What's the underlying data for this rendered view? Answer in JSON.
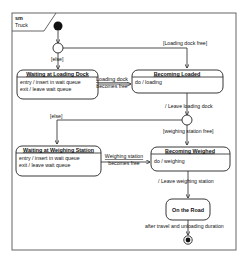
{
  "frame": {
    "kind": "sm",
    "name": "Truck"
  },
  "states": {
    "waiting_loading": {
      "name": "Waiting at Loading Dock",
      "entry": "entry / insert in wait queue",
      "exit": "exit / leave wait queue"
    },
    "becoming_loaded": {
      "name": "Becoming Loaded",
      "do": "do / loading"
    },
    "waiting_weighing": {
      "name": "Waiting at Weighing Station",
      "entry": "entry / insert in wait queue",
      "exit": "exit / leave wait queue"
    },
    "becoming_weighed": {
      "name": "Becoming Weighed",
      "do": "do / weighing"
    },
    "on_the_road": {
      "name": "On the Road"
    }
  },
  "transitions": {
    "else1": "[else]",
    "loading_free": "[Loading dock free]",
    "loading_becomes_free_1": "Loading dock",
    "loading_becomes_free_2": "becomes free",
    "leave_loading": "/ Leave loading dock",
    "else2": "[else]",
    "weighing_free": "[weighing station free]",
    "weighing_becomes_free_1": "Weighing station",
    "weighing_becomes_free_2": "becomes free",
    "leave_weighing": "/ Leave weighing station",
    "after_travel": "after travel and unloading duration"
  }
}
